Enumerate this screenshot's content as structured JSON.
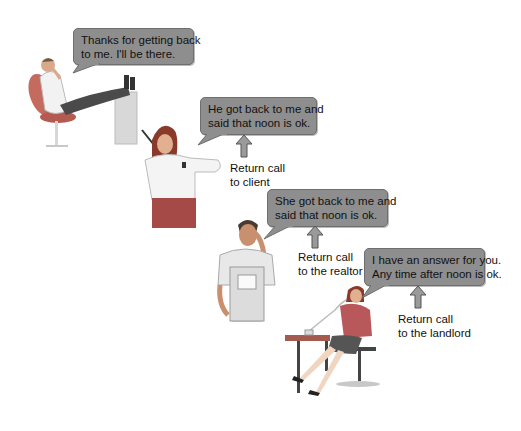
{
  "colors": {
    "bubble_fill": "#8e8e8e",
    "bubble_border": "#6e6e6e",
    "arrow_fill": "#9a9a9a",
    "text": "#111111",
    "background": "#ffffff"
  },
  "scenes": [
    {
      "speaker": "man reclining in chair with feet on desk",
      "bubble": {
        "lines": [
          "Thanks for getting back",
          "to me. I'll be there."
        ]
      }
    },
    {
      "speaker": "woman on phone checking watch",
      "bubble": {
        "lines": [
          "He got back to me and",
          "said that noon is ok."
        ]
      },
      "caption": {
        "lines": [
          "Return call",
          "to client"
        ]
      },
      "icon": "up-arrow-icon"
    },
    {
      "speaker": "man in overalls on phone",
      "bubble": {
        "lines": [
          "She got back to me and",
          "said that noon is ok."
        ]
      },
      "caption": {
        "lines": [
          "Return call",
          "to the realtor"
        ]
      },
      "icon": "up-arrow-icon"
    },
    {
      "speaker": "woman seated at table on phone",
      "bubble": {
        "lines": [
          "I have an answer for you.",
          "Any time after noon is ok."
        ]
      },
      "caption": {
        "lines": [
          "Return call",
          "to the landlord"
        ]
      },
      "icon": "up-arrow-icon"
    }
  ]
}
